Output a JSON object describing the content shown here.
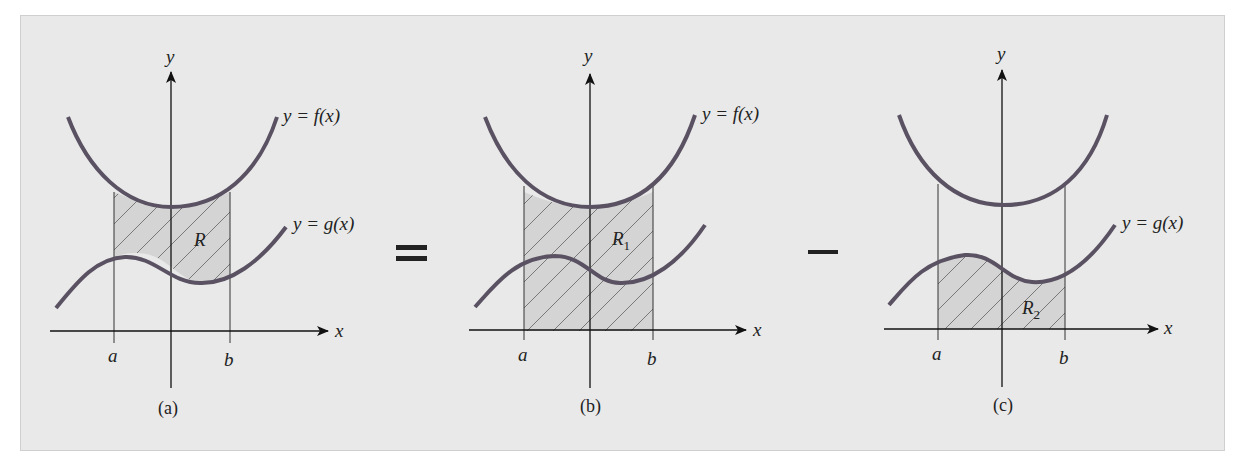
{
  "figure": {
    "background": "#e9e9e9",
    "curve_color": "#5a5262",
    "shade_color": "#d4d4d4",
    "operators": [
      "=",
      "−"
    ],
    "panels": [
      {
        "id": "a",
        "caption": "(a)",
        "axis_x_label": "x",
        "axis_y_label": "y",
        "a_label": "a",
        "b_label": "b",
        "f_label": "y = f(x)",
        "g_label": "y = g(x)",
        "region_label": "R",
        "region_sub": "",
        "shading": "between f and g on [a, b]"
      },
      {
        "id": "b",
        "caption": "(b)",
        "axis_x_label": "x",
        "axis_y_label": "y",
        "a_label": "a",
        "b_label": "b",
        "f_label": "y = f(x)",
        "g_label": "",
        "region_label": "R",
        "region_sub": "1",
        "shading": "under f on [a, b]"
      },
      {
        "id": "c",
        "caption": "(c)",
        "axis_x_label": "x",
        "axis_y_label": "y",
        "a_label": "a",
        "b_label": "b",
        "f_label": "",
        "g_label": "y = g(x)",
        "region_label": "R",
        "region_sub": "2",
        "shading": "under g on [a, b]"
      }
    ]
  }
}
